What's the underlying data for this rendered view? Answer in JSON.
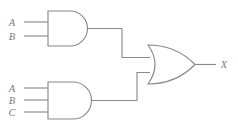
{
  "diagram": {
    "colors": {
      "background": "#ffffff",
      "line": "#8a8a8a",
      "label": "#7d7d7d"
    },
    "output_expression": "X = AB + ABC",
    "gates": [
      {
        "id": "and-gate-top",
        "type": "AND",
        "label": "AND",
        "inputs": [
          "A",
          "B"
        ],
        "output": "AB"
      },
      {
        "id": "and-gate-bottom",
        "type": "AND",
        "label": "AND",
        "inputs": [
          "A",
          "B",
          "C"
        ],
        "output": "ABC"
      },
      {
        "id": "or-gate",
        "type": "OR",
        "label": "OR",
        "inputs": [
          "AB",
          "ABC"
        ],
        "output": "X"
      }
    ],
    "input_labels": {
      "top_gate": [
        {
          "name": "A",
          "text": "A"
        },
        {
          "name": "B",
          "text": "B"
        }
      ],
      "bottom_gate": [
        {
          "name": "A",
          "text": "A"
        },
        {
          "name": "B",
          "text": "B"
        },
        {
          "name": "C",
          "text": "C"
        }
      ]
    },
    "output_label": {
      "name": "X",
      "text": "X"
    }
  }
}
